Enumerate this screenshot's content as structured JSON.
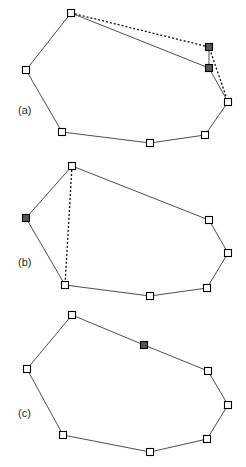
{
  "figure": {
    "width": 246,
    "height": 467,
    "background_color": "#ffffff",
    "stroke_color": "#3a3a3a",
    "marker_open_fill": "#ffffff",
    "marker_filled_fill": "#565656",
    "marker_border_color": "#000000",
    "marker_size": 7,
    "line_width": 0.9,
    "dash_pattern": "2,2"
  },
  "panels": [
    {
      "id": "panel-a",
      "label": "(a)",
      "label_x": 18,
      "label_y": 114,
      "outline": [
        {
          "name": "top",
          "x": 71,
          "y": 13,
          "state": "open"
        },
        {
          "name": "upper-right-filled",
          "x": 209,
          "y": 47,
          "state": "filled"
        },
        {
          "name": "mid-right-filled",
          "x": 209,
          "y": 68,
          "state": "filled"
        },
        {
          "name": "right",
          "x": 228,
          "y": 102,
          "state": "open"
        },
        {
          "name": "lower-right",
          "x": 205,
          "y": 135,
          "state": "open"
        },
        {
          "name": "bottom",
          "x": 150,
          "y": 143,
          "state": "open"
        },
        {
          "name": "bottom-left",
          "x": 62,
          "y": 132,
          "state": "open"
        },
        {
          "name": "left",
          "x": 26,
          "y": 70,
          "state": "open"
        }
      ],
      "solid_path": [
        [
          71,
          13
        ],
        [
          209,
          68
        ],
        [
          228,
          102
        ],
        [
          205,
          135
        ],
        [
          150,
          143
        ],
        [
          62,
          132
        ],
        [
          26,
          70
        ],
        [
          71,
          13
        ]
      ],
      "dashed_paths": [
        [
          [
            71,
            13
          ],
          [
            209,
            47
          ],
          [
            228,
            102
          ]
        ]
      ],
      "connector_segments": [
        [
          [
            209,
            47
          ],
          [
            209,
            68
          ]
        ]
      ]
    },
    {
      "id": "panel-b",
      "label": "(b)",
      "label_x": 18,
      "label_y": 266,
      "outline": [
        {
          "name": "top",
          "x": 72,
          "y": 166,
          "state": "open"
        },
        {
          "name": "upper-right",
          "x": 209,
          "y": 220,
          "state": "open"
        },
        {
          "name": "right",
          "x": 228,
          "y": 253,
          "state": "open"
        },
        {
          "name": "lower-right",
          "x": 207,
          "y": 288,
          "state": "open"
        },
        {
          "name": "bottom",
          "x": 150,
          "y": 296,
          "state": "open"
        },
        {
          "name": "bottom-left",
          "x": 65,
          "y": 285,
          "state": "open"
        },
        {
          "name": "left-filled",
          "x": 26,
          "y": 218,
          "state": "filled"
        }
      ],
      "solid_path": [
        [
          72,
          166
        ],
        [
          209,
          220
        ],
        [
          228,
          253
        ],
        [
          207,
          288
        ],
        [
          150,
          296
        ],
        [
          65,
          285
        ],
        [
          26,
          218
        ],
        [
          72,
          166
        ]
      ],
      "dashed_paths": [
        [
          [
            72,
            166
          ],
          [
            65,
            285
          ]
        ]
      ],
      "connector_segments": []
    },
    {
      "id": "panel-c",
      "label": "(c)",
      "label_x": 18,
      "label_y": 417,
      "outline": [
        {
          "name": "top",
          "x": 72,
          "y": 315,
          "state": "open"
        },
        {
          "name": "top-right-filled",
          "x": 144,
          "y": 345,
          "state": "filled"
        },
        {
          "name": "upper-right",
          "x": 208,
          "y": 371,
          "state": "open"
        },
        {
          "name": "right",
          "x": 228,
          "y": 405,
          "state": "open"
        },
        {
          "name": "lower-right",
          "x": 207,
          "y": 439,
          "state": "open"
        },
        {
          "name": "bottom",
          "x": 150,
          "y": 452,
          "state": "open"
        },
        {
          "name": "bottom-left",
          "x": 63,
          "y": 435,
          "state": "open"
        },
        {
          "name": "left",
          "x": 27,
          "y": 369,
          "state": "open"
        }
      ],
      "solid_path": [
        [
          72,
          315
        ],
        [
          144,
          345
        ],
        [
          208,
          371
        ],
        [
          228,
          405
        ],
        [
          207,
          439
        ],
        [
          150,
          452
        ],
        [
          63,
          435
        ],
        [
          27,
          369
        ],
        [
          72,
          315
        ]
      ],
      "dashed_paths": [],
      "connector_segments": []
    }
  ]
}
